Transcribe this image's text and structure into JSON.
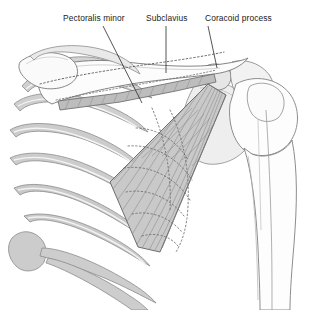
{
  "figure": {
    "background_color": "#ffffff",
    "width": 310,
    "height": 310
  },
  "labels": [
    {
      "id": "pectoralis-minor",
      "text": "Pectoralis minor",
      "text_x": 63,
      "text_y": 21,
      "leader": {
        "x1": 103,
        "y1": 26,
        "x2": 142,
        "y2": 103
      }
    },
    {
      "id": "subclavius",
      "text": "Subclavius",
      "text_x": 146,
      "text_y": 21,
      "leader": {
        "x1": 166,
        "y1": 26,
        "x2": 166,
        "y2": 73
      }
    },
    {
      "id": "coracoid-process",
      "text": "Coracoid process",
      "text_x": 205,
      "text_y": 21,
      "leader": {
        "x1": 208,
        "y1": 26,
        "x2": 217,
        "y2": 68
      }
    }
  ],
  "structures": {
    "pectoralis_minor": {
      "name": "Pectoralis minor",
      "fill_color": "#c9c9c9",
      "outline_color": "#6e6e6e",
      "fiber_color": "#8f8f8f",
      "description": "Triangular muscle, fibers converge superolaterally to coracoid process"
    },
    "subclavius": {
      "name": "Subclavius",
      "fill_color": "#bdbdbd",
      "outline_color": "#666666",
      "dotted_outline_color": "#555555",
      "description": "Grey band beneath the clavicle with dotted hidden border"
    },
    "clavicle": {
      "name": "Clavicle",
      "fill_color": "#fbfbfb",
      "outline_color": "#777777"
    },
    "ribs": {
      "name": "Ribs and costal cartilages",
      "fill_color": "#cfcfcf",
      "highlight_color": "#f4f4f4",
      "outline_color": "#8a8a8a"
    },
    "scapula": {
      "name": "Scapula",
      "fill_color": "#ececec",
      "outline_color": "#8a8a8a"
    },
    "humerus": {
      "name": "Humerus",
      "fill_color": "#fdfdfd",
      "outline_color": "#808080"
    },
    "hidden_ribs": {
      "name": "Ribs deep to pectoralis minor",
      "line_style": "dotted",
      "line_color": "#6b6b6b"
    }
  }
}
